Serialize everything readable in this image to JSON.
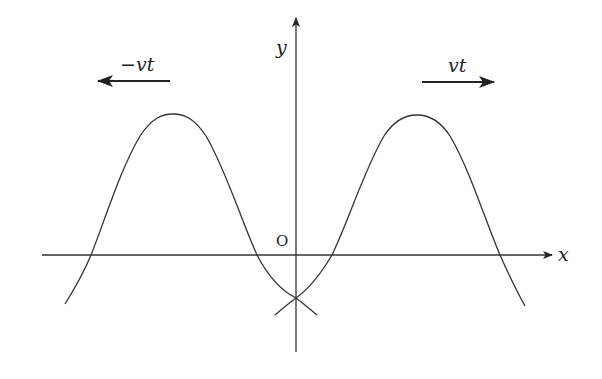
{
  "diagram": {
    "colors": {
      "stroke": "#333333",
      "background": "#ffffff",
      "text": "#222222"
    },
    "axes": {
      "x_label": "x",
      "y_label": "y",
      "origin_label": "O"
    },
    "arrows": [
      {
        "id": "left",
        "label": "−vt",
        "direction": "left"
      },
      {
        "id": "right",
        "label": "vt",
        "direction": "right"
      }
    ],
    "curves": [
      {
        "id": "left-pulse",
        "description": "pulse centered left of origin, moving left"
      },
      {
        "id": "right-pulse",
        "description": "pulse centered right of origin, moving right"
      }
    ]
  }
}
